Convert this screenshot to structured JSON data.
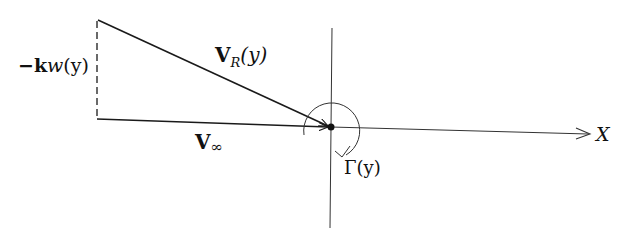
{
  "diagram": {
    "type": "vector-diagram",
    "labels": {
      "downwash": {
        "prefix": "−",
        "bold": "k",
        "italic": "w",
        "arg": "(y)"
      },
      "resultant": {
        "bold": "V",
        "sub": "R",
        "arg": "(y)"
      },
      "freestream": {
        "bold": "V",
        "sub": "∞"
      },
      "circulation": {
        "text": "Γ(y)"
      },
      "x_axis": "X"
    },
    "elements": [
      "freestream-vector",
      "resultant-vector",
      "downwash-dashed-line",
      "x-axis",
      "vertical-axis",
      "circulation-arc",
      "origin-point"
    ],
    "colors": {
      "ink": "#1a1a1a",
      "background": "#ffffff"
    }
  }
}
